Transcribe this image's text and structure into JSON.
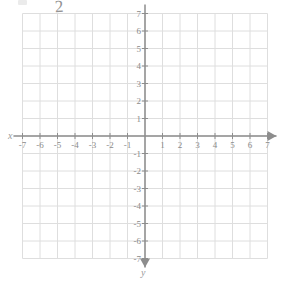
{
  "figure": {
    "kind": "cartesian-coordinate-plane",
    "title": "",
    "axis_labels": {
      "x": "x",
      "y": "y"
    },
    "annotation": {
      "text": "2",
      "description": "faint handwritten mark near top of image"
    }
  },
  "chart_data": {
    "type": "scatter",
    "title": "",
    "xlabel": "x",
    "ylabel": "y",
    "xlim": [
      -7,
      7
    ],
    "ylim": [
      -7,
      7
    ],
    "grid": true,
    "legend": null,
    "series": [],
    "x_ticks": [
      -7,
      -6,
      -5,
      -4,
      -3,
      -2,
      -1,
      1,
      2,
      3,
      4,
      5,
      6,
      7
    ],
    "y_ticks": [
      7,
      6,
      5,
      4,
      3,
      2,
      1,
      -1,
      -2,
      -3,
      -4,
      -5,
      -6,
      -7
    ],
    "x_tick_labels": [
      "-7",
      "-6",
      "-5",
      "-4",
      "-3",
      "-2",
      "-1",
      "1",
      "2",
      "3",
      "4",
      "5",
      "6",
      "7"
    ],
    "y_tick_labels": [
      "7",
      "6",
      "5",
      "4",
      "3",
      "2",
      "1",
      "-1",
      "-2",
      "-3",
      "-4",
      "-5",
      "-6",
      "-7"
    ],
    "origin_label": "",
    "arrows": [
      "left",
      "right",
      "up",
      "down"
    ]
  },
  "colors": {
    "grid": "#dedede",
    "axis": "#8d8d8d",
    "label": "#8a8a8a",
    "background": "#ffffff"
  },
  "geometry": {
    "origin_x": 145,
    "origin_y": 136,
    "unit_px": 17.5
  }
}
